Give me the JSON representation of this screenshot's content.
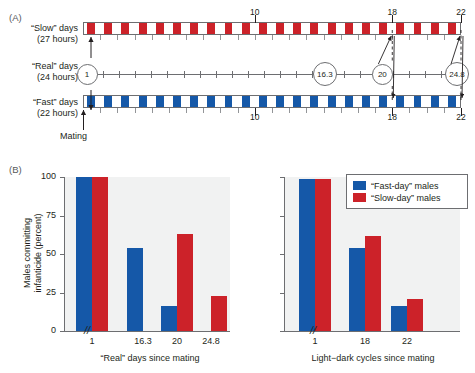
{
  "figure": {
    "panelA": {
      "label": "(A)",
      "rows": [
        {
          "name": "slow",
          "line1": "“Slow” days",
          "line2": "(27 hours)",
          "color": "#cc2229",
          "cycles": 22,
          "tick_labels": [
            "10",
            "18",
            "22"
          ],
          "tick_values": [
            10,
            18,
            22
          ]
        },
        {
          "name": "real",
          "line1": "“Real” days",
          "line2": "(24 hours)",
          "color": "#6d6e71",
          "markers": [
            "1",
            "16.3",
            "20",
            "24.8"
          ],
          "marker_values": [
            1,
            16.3,
            20,
            24.8
          ]
        },
        {
          "name": "fast",
          "line1": "“Fast” days",
          "line2": "(22 hours)",
          "color": "#1558a8",
          "cycles": 22,
          "tick_labels": [
            "10",
            "18",
            "22"
          ],
          "tick_values": [
            10,
            18,
            22
          ]
        }
      ],
      "mating_label": "Mating"
    },
    "panelB": {
      "label": "(B)",
      "ylabel_line1": "Males committing",
      "ylabel_line2": "infanticide (percent)",
      "break_glyph": "//",
      "legend": {
        "items": [
          {
            "label": "“Fast-day” males",
            "color": "#1558a8"
          },
          {
            "label": "“Slow-day” males",
            "color": "#cc2229"
          }
        ]
      }
    }
  },
  "colors": {
    "blue": "#1558a8",
    "red": "#cc2229",
    "plot_bg": "#f1f2f2",
    "axis": "#6d6e71"
  },
  "chart_data": [
    {
      "type": "bar",
      "name": "left-chart",
      "title": "",
      "xlabel": "“Real” days since mating",
      "ylabel": "Males committing infanticide (percent)",
      "categories": [
        "1",
        "16.3",
        "20",
        "24.8"
      ],
      "yticks": [
        0,
        25,
        50,
        75,
        100
      ],
      "ylim": [
        0,
        100
      ],
      "grid": false,
      "axis_break_after_category": "1",
      "series": [
        {
          "name": "“Fast-day” males",
          "color": "#1558a8",
          "values": [
            100,
            54,
            16,
            null
          ]
        },
        {
          "name": "“Slow-day” males",
          "color": "#cc2229",
          "values": [
            100,
            null,
            63,
            23
          ]
        }
      ]
    },
    {
      "type": "bar",
      "name": "right-chart",
      "title": "",
      "xlabel": "Light−dark cycles since mating",
      "ylabel": "Males committing infanticide (percent)",
      "categories": [
        "1",
        "18",
        "22"
      ],
      "yticks": [
        0,
        25,
        50,
        75,
        100
      ],
      "ylim": [
        0,
        100
      ],
      "grid": false,
      "axis_break_after_category": "1",
      "series": [
        {
          "name": "“Fast-day” males",
          "color": "#1558a8",
          "values": [
            99,
            54,
            16
          ]
        },
        {
          "name": "“Slow-day” males",
          "color": "#cc2229",
          "values": [
            99,
            62,
            21
          ]
        }
      ]
    }
  ]
}
